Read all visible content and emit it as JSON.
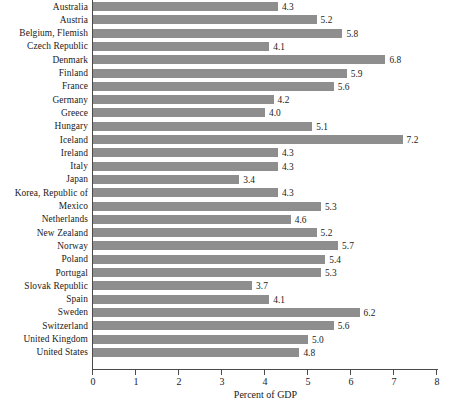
{
  "chart_data": {
    "type": "bar",
    "orientation": "horizontal",
    "title": "",
    "xlabel": "Percent of GDP",
    "ylabel": "",
    "xlim": [
      0,
      8
    ],
    "xticks": [
      0,
      1,
      2,
      3,
      4,
      5,
      6,
      7,
      8
    ],
    "xtick_labels": [
      "0",
      "1",
      "2",
      "3",
      "4",
      "5",
      "6",
      "7",
      "8"
    ],
    "grid": false,
    "legend": null,
    "bar_color": "#8e8e8e",
    "axis_color": "#4a4a4a",
    "background_color": "#ffffff",
    "value_label_format": "one-decimal",
    "categories": [
      "Australia",
      "Austria",
      "Belgium, Flemish",
      "Czech Republic",
      "Denmark",
      "Finland",
      "France",
      "Germany",
      "Greece",
      "Hungary",
      "Iceland",
      "Ireland",
      "Italy",
      "Japan",
      "Korea, Republic of",
      "Mexico",
      "Netherlands",
      "New Zealand",
      "Norway",
      "Poland",
      "Portugal",
      "Slovak Republic",
      "Spain",
      "Sweden",
      "Switzerland",
      "United Kingdom",
      "United States"
    ],
    "values": [
      4.3,
      5.2,
      5.8,
      4.1,
      6.8,
      5.9,
      5.6,
      4.2,
      4.0,
      5.1,
      7.2,
      4.3,
      4.3,
      3.4,
      4.3,
      5.3,
      4.6,
      5.2,
      5.7,
      5.4,
      5.3,
      3.7,
      4.1,
      6.2,
      5.6,
      5.0,
      4.8
    ],
    "value_labels": [
      "4.3",
      "5.2",
      "5.8",
      "4.1",
      "6.8",
      "5.9",
      "5.6",
      "4.2",
      "4.0",
      "5.1",
      "7.2",
      "4.3",
      "4.3",
      "3.4",
      "4.3",
      "5.3",
      "4.6",
      "5.2",
      "5.7",
      "5.4",
      "5.3",
      "3.7",
      "4.1",
      "6.2",
      "5.6",
      "5.0",
      "4.8"
    ]
  }
}
